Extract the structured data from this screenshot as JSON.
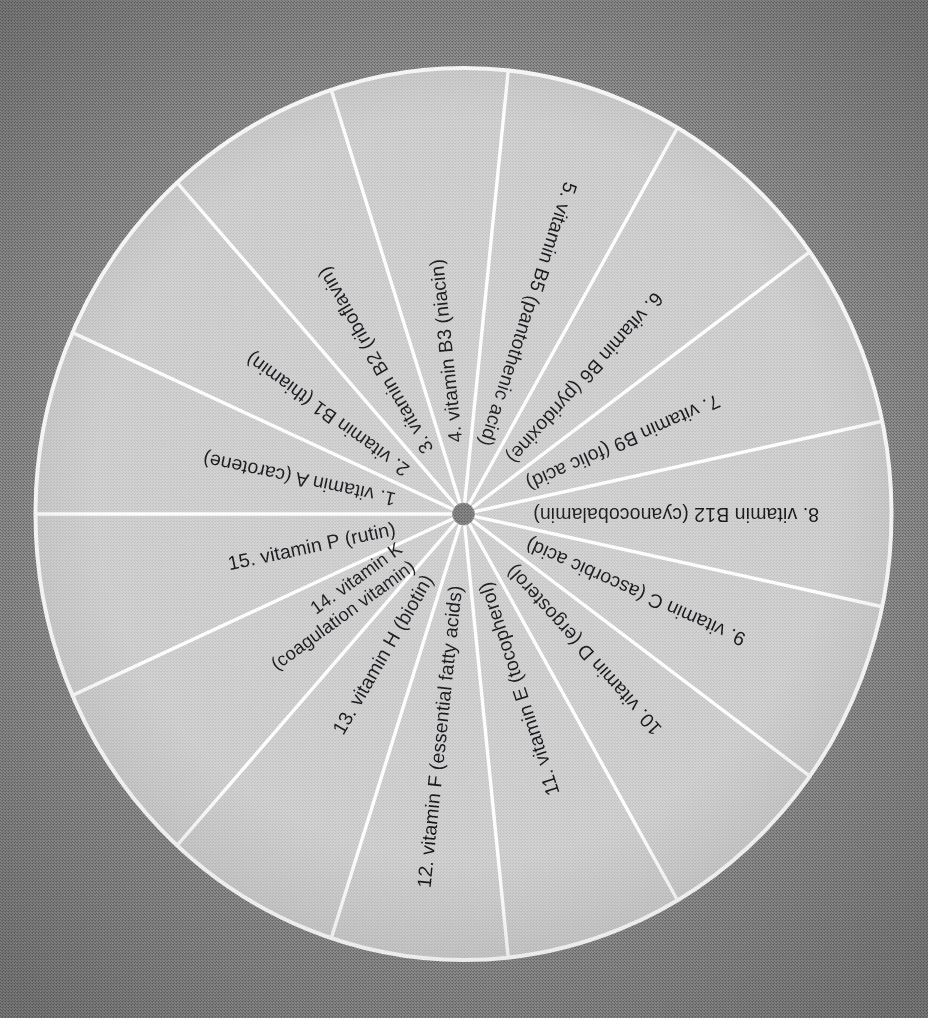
{
  "figure": {
    "name": "vitamin-wheel",
    "type": "pie",
    "background_color": "#7e7e7e",
    "sector_color": "#c9c9c9",
    "divider_color": "#fdfdfd",
    "hub_color": "#6e6e6e",
    "text_color": "#16161a",
    "segment_count": 15
  },
  "chart_data": {
    "type": "pie",
    "title": "",
    "subtitle": "",
    "xlabel": "",
    "ylabel": "",
    "legend_position": "none",
    "grid": false,
    "equal_slices": true,
    "slice_angle_degrees": 24,
    "categories": [
      "1. vitamin A (carotene)",
      "2. vitamin B1 (thiamin)",
      "3. vitamin B2 (riboflavin)",
      "4. vitamin B3 (niacin)",
      "5. vitamin B5 (pantothenic acid)",
      "6. vitamin B6 (pyridoxine)",
      "7. vitamin B9 (folic acid)",
      "8. vitamin B12 (cyanocobalamin)",
      "9. vitamin C (ascorbic acid)",
      "10. vitamin D (ergosterol)",
      "11. vitamin E (tocopherol)",
      "12. vitamin F (essential fatty acids)",
      "13. vitamin H (biotin)",
      "14. vitamin K (coagulation vitamin)",
      "15. vitamin P (rutin)"
    ],
    "values": [
      6.667,
      6.667,
      6.667,
      6.667,
      6.667,
      6.667,
      6.667,
      6.667,
      6.667,
      6.667,
      6.667,
      6.667,
      6.667,
      6.667,
      6.667
    ]
  },
  "segments": [
    {
      "index": "1",
      "number": "1.",
      "name": "vitamin A",
      "detail": "(carotene)",
      "label": "1. vitamin A (carotene)",
      "line1": "1. vitamin A (carotene)",
      "line2": ""
    },
    {
      "index": "2",
      "number": "2.",
      "name": "vitamin B1",
      "detail": "(thiamin)",
      "label": "2. vitamin B1 (thiamin)",
      "line1": "2. vitamin B1 (thiamin)",
      "line2": ""
    },
    {
      "index": "3",
      "number": "3.",
      "name": "vitamin B2",
      "detail": "(riboflavin)",
      "label": "3. vitamin B2 (riboflavin)",
      "line1": "3. vitamin B2 (riboflavin)",
      "line2": ""
    },
    {
      "index": "4",
      "number": "4.",
      "name": "vitamin B3",
      "detail": "(niacin)",
      "label": "4. vitamin B3 (niacin)",
      "line1": "4. vitamin B3 (niacin)",
      "line2": ""
    },
    {
      "index": "5",
      "number": "5.",
      "name": "vitamin B5",
      "detail": "(pantothenic acid)",
      "label": "5. vitamin B5 (pantothenic acid)",
      "line1": "5. vitamin B5 (pantothenic acid)",
      "line2": ""
    },
    {
      "index": "6",
      "number": "6.",
      "name": "vitamin B6",
      "detail": "(pyridoxine)",
      "label": "6. vitamin B6 (pyridoxine)",
      "line1": "6. vitamin B6 (pyridoxine)",
      "line2": ""
    },
    {
      "index": "7",
      "number": "7.",
      "name": "vitamin B9",
      "detail": "(folic acid)",
      "label": "7. vitamin B9 (folic acid)",
      "line1": "7. vitamin B9 (folic acid)",
      "line2": ""
    },
    {
      "index": "8",
      "number": "8.",
      "name": "vitamin B12",
      "detail": "(cyanocobalamin)",
      "label": "8. vitamin B12 (cyanocobalamin)",
      "line1": "8. vitamin B12 (cyanocobalamin)",
      "line2": ""
    },
    {
      "index": "9",
      "number": "9.",
      "name": "vitamin C",
      "detail": "(ascorbic acid)",
      "label": "9. vitamin C (ascorbic acid)",
      "line1": "9. vitamin C (ascorbic acid)",
      "line2": ""
    },
    {
      "index": "10",
      "number": "10.",
      "name": "vitamin D",
      "detail": "(ergosterol)",
      "label": "10. vitamin D (ergosterol)",
      "line1": "10. vitamin D (ergosterol)",
      "line2": ""
    },
    {
      "index": "11",
      "number": "11.",
      "name": "vitamin E",
      "detail": "(tocopherol)",
      "label": "11. vitamin E (tocopherol)",
      "line1": "11. vitamin E (tocopherol)",
      "line2": ""
    },
    {
      "index": "12",
      "number": "12.",
      "name": "vitamin F",
      "detail": "(essential fatty acids)",
      "label": "12. vitamin F (essential fatty acids)",
      "line1": "12. vitamin F (essential fatty acids)",
      "line2": ""
    },
    {
      "index": "13",
      "number": "13.",
      "name": "vitamin H",
      "detail": "(biotin)",
      "label": "13. vitamin H (biotin)",
      "line1": "13. vitamin H (biotin)",
      "line2": ""
    },
    {
      "index": "14",
      "number": "14.",
      "name": "vitamin K",
      "detail": "(coagulation vitamin)",
      "label": "14. vitamin K (coagulation vitamin)",
      "line1": "14.  vitamin K",
      "line2": "(coagulation vitamin)"
    },
    {
      "index": "15",
      "number": "15.",
      "name": "vitamin P",
      "detail": "(rutin)",
      "label": "15. vitamin P (rutin)",
      "line1": "15.  vitamin P (rutin)",
      "line2": ""
    }
  ]
}
